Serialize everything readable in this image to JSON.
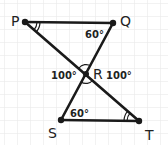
{
  "diagram": {
    "type": "geometry",
    "grid": {
      "spacing": 13,
      "color": "#e6e6e6"
    },
    "colors": {
      "line": "#1a1a1a",
      "text": "#222222",
      "background": "#ffffff"
    },
    "points": {
      "P": {
        "label": "P",
        "x": 25,
        "y": 22
      },
      "Q": {
        "label": "Q",
        "x": 113,
        "y": 23
      },
      "R": {
        "label": "R",
        "x": 86,
        "y": 74
      },
      "S": {
        "label": "S",
        "x": 61,
        "y": 120
      },
      "T": {
        "label": "T",
        "x": 139,
        "y": 121
      }
    },
    "segments": [
      "PQ",
      "PT",
      "QS",
      "ST"
    ],
    "angles": {
      "PQR": "60°",
      "RST": "60°",
      "PRS": "100°",
      "QRT": "100°",
      "QPR_mark": "double-arc",
      "STR_mark": "double-arc"
    }
  }
}
